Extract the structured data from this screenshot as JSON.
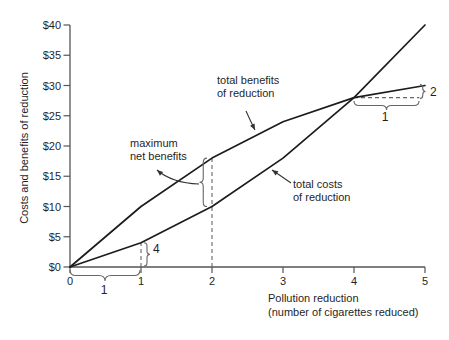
{
  "figure": {
    "background": "#ffffff",
    "curve_color": "#1c1c1c",
    "axis_color": "#555555",
    "annotation_color": "#666666",
    "text_color": "#1f1f1f"
  },
  "chart_data": {
    "type": "line",
    "title": "",
    "xlabel": "Pollution reduction (number of cigarettes reduced)",
    "xlabel_lines": [
      "Pollution reduction",
      "(number of cigarettes reduced)"
    ],
    "ylabel": "Costs and benefits of reduction",
    "xlim": [
      0,
      5
    ],
    "ylim": [
      0,
      40
    ],
    "x_ticks": [
      "0",
      "1",
      "2",
      "3",
      "4",
      "5"
    ],
    "y_ticks": [
      "$0",
      "$5",
      "$10",
      "$15",
      "$20",
      "$25",
      "$30",
      "$35",
      "$40"
    ],
    "grid": false,
    "legend": "none",
    "x": [
      0,
      1,
      2,
      3,
      4,
      5
    ],
    "series": [
      {
        "name": "total benefits of reduction",
        "values": [
          0,
          10,
          18,
          24,
          28,
          30
        ]
      },
      {
        "name": "total costs of reduction",
        "values": [
          0,
          4,
          10,
          18,
          28,
          40
        ]
      }
    ],
    "annotations": [
      {
        "id": "benefits-label",
        "text_lines": [
          "total benefits",
          "of reduction"
        ],
        "points_to": "benefits curve"
      },
      {
        "id": "costs-label",
        "text_lines": [
          "total costs",
          "of reduction"
        ],
        "points_to": "costs curve"
      },
      {
        "id": "max-net-label",
        "text_lines": [
          "maximum",
          "net benefits"
        ],
        "points_to": "brace between curves at x=2"
      }
    ],
    "slope_markers": [
      {
        "curve": "total costs of reduction",
        "from_x": 0,
        "to_x": 1,
        "run_label": "1",
        "rise_label": "4"
      },
      {
        "curve": "total benefits of reduction",
        "from_x": 4,
        "to_x": 5,
        "run_label": "1",
        "rise_label": "2"
      }
    ],
    "guides": [
      {
        "type": "v",
        "x": 1,
        "y_from": 0,
        "y_to": 4
      },
      {
        "type": "v",
        "x": 2,
        "y_from": 0,
        "y_to": 18
      },
      {
        "type": "h",
        "y": 28,
        "x_from": 4,
        "x_to": 4.92
      }
    ]
  }
}
